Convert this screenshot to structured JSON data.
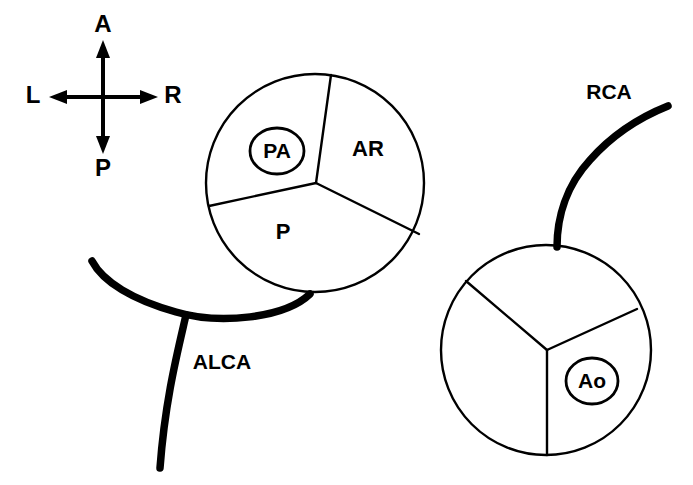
{
  "figure": {
    "background_color": "#ffffff",
    "line_color": "#000000",
    "width": 693,
    "height": 485
  },
  "orientation_compass": {
    "name": "anatomic-orientation-indicator",
    "anterior": "A",
    "posterior": "P",
    "left": "L",
    "right": "R",
    "center_x": 103,
    "center_y": 97
  },
  "pulmonary_artery": {
    "name": "pulmonary-artery-cross-section",
    "callout_label": "PA",
    "center_x": 315,
    "center_y": 183,
    "radius": 109,
    "sinuses": [
      {
        "id": "anterior-left-sinus",
        "label": "PA",
        "circled": true,
        "label_x": 277,
        "label_y": 151
      },
      {
        "id": "anterior-right-sinus",
        "label": "AR",
        "circled": false,
        "label_x": 368,
        "label_y": 149
      },
      {
        "id": "posterior-sinus",
        "label": "P",
        "circled": false,
        "label_x": 283,
        "label_y": 232
      }
    ]
  },
  "aorta": {
    "name": "aorta-cross-section",
    "callout_label": "Ao",
    "center_x": 546,
    "center_y": 350,
    "radius": 105,
    "sinuses": [
      {
        "id": "right-sinus",
        "label": "Ao",
        "circled": true,
        "label_x": 592,
        "label_y": 381
      },
      {
        "id": "left-sinus",
        "label": "",
        "circled": false
      },
      {
        "id": "non-coronary-sinus",
        "label": "",
        "circled": false
      }
    ]
  },
  "arteries": [
    {
      "id": "alca",
      "name": "anomalous-left-coronary-artery",
      "label": "ALCA",
      "label_x": 222,
      "label_y": 362,
      "origin": "pulmonary artery",
      "stroke_width": 7.5
    },
    {
      "id": "rca",
      "name": "right-coronary-artery",
      "label": "RCA",
      "label_x": 609,
      "label_y": 93,
      "origin": "aorta",
      "stroke_width": 7.5
    }
  ],
  "labels": {
    "pa": "PA",
    "ar": "AR",
    "p": "P",
    "ao": "Ao",
    "alca": "ALCA",
    "rca": "RCA",
    "axis_a": "A",
    "axis_p": "P",
    "axis_l": "L",
    "axis_r": "R"
  }
}
